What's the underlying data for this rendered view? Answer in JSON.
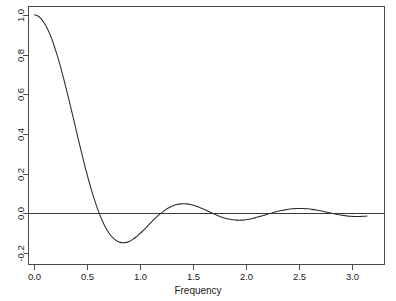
{
  "chart_data": {
    "type": "line",
    "title": "",
    "subtitle": "",
    "xlabel": "Frequency",
    "ylabel": "",
    "xlim": [
      -0.06,
      3.3
    ],
    "ylim": [
      -0.255,
      1.045
    ],
    "grid": false,
    "legend": null,
    "annotations": [],
    "reference_lines": [
      {
        "axis": "y",
        "value": 0.0,
        "style": "solid"
      }
    ],
    "xticks": [
      0.0,
      0.5,
      1.0,
      1.5,
      2.0,
      2.5,
      3.0
    ],
    "xticklabels": [
      "0.0",
      "0.5",
      "1.0",
      "1.5",
      "2.0",
      "2.5",
      "3.0"
    ],
    "yticks": [
      -0.2,
      0.0,
      0.2,
      0.4,
      0.6,
      0.8,
      1.0
    ],
    "yticklabels": [
      "-0.2",
      "0.0",
      "0.2",
      "0.4",
      "0.6",
      "0.8",
      "1.0"
    ],
    "series": [
      {
        "name": "spectral window",
        "color": "#2b2b2b",
        "x": [
          0.0,
          0.03,
          0.06,
          0.09,
          0.12,
          0.15,
          0.18,
          0.21,
          0.24,
          0.27,
          0.3,
          0.33,
          0.36,
          0.39,
          0.42,
          0.45,
          0.48,
          0.51,
          0.54,
          0.57,
          0.6,
          0.63,
          0.66,
          0.69,
          0.72,
          0.75,
          0.78,
          0.81,
          0.84,
          0.87,
          0.9,
          0.93,
          0.96,
          0.99,
          1.02,
          1.05,
          1.08,
          1.11,
          1.14,
          1.17,
          1.2,
          1.23,
          1.26,
          1.29,
          1.32,
          1.35,
          1.38,
          1.41,
          1.44,
          1.47,
          1.5,
          1.53,
          1.56,
          1.59,
          1.62,
          1.65,
          1.68,
          1.71,
          1.74,
          1.77,
          1.8,
          1.83,
          1.86,
          1.89,
          1.92,
          1.95,
          1.98,
          2.01,
          2.04,
          2.07,
          2.1,
          2.13,
          2.16,
          2.19,
          2.22,
          2.25,
          2.28,
          2.31,
          2.34,
          2.37,
          2.4,
          2.43,
          2.46,
          2.49,
          2.52,
          2.55,
          2.58,
          2.61,
          2.64,
          2.67,
          2.7,
          2.73,
          2.76,
          2.79,
          2.82,
          2.85,
          2.88,
          2.91,
          2.94,
          2.97,
          3.0,
          3.03,
          3.06,
          3.09,
          3.12,
          3.14
        ],
        "y": [
          1.0,
          0.996,
          0.983,
          0.962,
          0.934,
          0.898,
          0.855,
          0.806,
          0.752,
          0.693,
          0.63,
          0.565,
          0.498,
          0.43,
          0.362,
          0.296,
          0.232,
          0.172,
          0.116,
          0.064,
          0.018,
          -0.023,
          -0.058,
          -0.087,
          -0.11,
          -0.127,
          -0.139,
          -0.146,
          -0.148,
          -0.146,
          -0.14,
          -0.131,
          -0.119,
          -0.105,
          -0.09,
          -0.074,
          -0.057,
          -0.041,
          -0.025,
          -0.01,
          0.003,
          0.015,
          0.026,
          0.034,
          0.041,
          0.045,
          0.048,
          0.049,
          0.048,
          0.045,
          0.041,
          0.036,
          0.03,
          0.023,
          0.016,
          0.008,
          0.001,
          -0.006,
          -0.013,
          -0.019,
          -0.024,
          -0.028,
          -0.031,
          -0.033,
          -0.034,
          -0.034,
          -0.033,
          -0.031,
          -0.028,
          -0.024,
          -0.02,
          -0.015,
          -0.011,
          -0.006,
          -0.001,
          0.003,
          0.008,
          0.012,
          0.015,
          0.018,
          0.021,
          0.023,
          0.024,
          0.025,
          0.025,
          0.024,
          0.023,
          0.021,
          0.019,
          0.016,
          0.013,
          0.01,
          0.006,
          0.003,
          -0.001,
          -0.004,
          -0.007,
          -0.01,
          -0.012,
          -0.014,
          -0.015,
          -0.016,
          -0.016,
          -0.015,
          -0.014,
          -0.013
        ]
      }
    ],
    "curve_features": {
      "start_value": 1.0,
      "first_zero_crossing": 0.3,
      "global_min": {
        "x": 0.44,
        "y": -0.225
      },
      "peaks": [
        {
          "x": 0.73,
          "y": 0.13
        },
        {
          "x": 1.35,
          "y": 0.07
        },
        {
          "x": 1.95,
          "y": 0.055
        },
        {
          "x": 2.54,
          "y": 0.045
        },
        {
          "x": 3.14,
          "y": 0.04
        }
      ],
      "troughs": [
        {
          "x": 0.44,
          "y": -0.225
        },
        {
          "x": 1.04,
          "y": -0.1
        },
        {
          "x": 1.65,
          "y": -0.07
        },
        {
          "x": 2.25,
          "y": -0.055
        },
        {
          "x": 2.85,
          "y": -0.05
        }
      ]
    }
  },
  "axis": {
    "x_title": "Frequency",
    "y_title": ""
  }
}
